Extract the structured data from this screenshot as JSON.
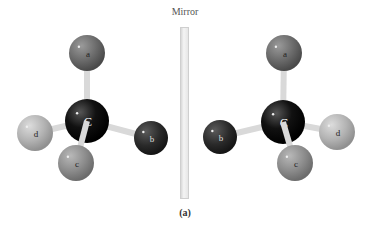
{
  "figure": {
    "mirror_label": "Mirror",
    "caption": "(a)"
  },
  "colors": {
    "carbon": "#151515",
    "a": "#6f6f6f",
    "b": "#2c2c2c",
    "c": "#8f8f8f",
    "d": "#b5b5b5",
    "bond": "#d9d9d9"
  },
  "molecules": [
    {
      "name": "left",
      "center": {
        "label": "C",
        "x": 87,
        "y": 121,
        "r": 22
      },
      "atoms": [
        {
          "label": "a",
          "x": 87,
          "y": 53,
          "r": 18
        },
        {
          "label": "b",
          "x": 151,
          "y": 138,
          "r": 17
        },
        {
          "label": "c",
          "x": 76,
          "y": 163,
          "r": 18
        },
        {
          "label": "d",
          "x": 35,
          "y": 133,
          "r": 18
        }
      ]
    },
    {
      "name": "right",
      "center": {
        "label": "C",
        "x": 283,
        "y": 122,
        "r": 22
      },
      "atoms": [
        {
          "label": "a",
          "x": 284,
          "y": 53,
          "r": 18
        },
        {
          "label": "b",
          "x": 220,
          "y": 137,
          "r": 17
        },
        {
          "label": "c",
          "x": 295,
          "y": 163,
          "r": 18
        },
        {
          "label": "d",
          "x": 337,
          "y": 132,
          "r": 18
        }
      ]
    }
  ]
}
